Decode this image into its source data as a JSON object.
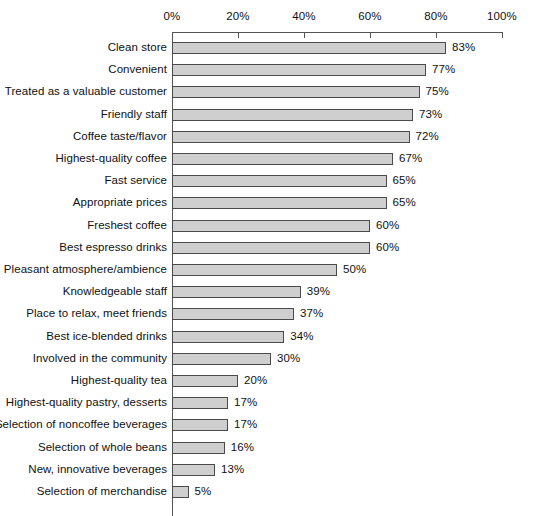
{
  "chart_data": {
    "type": "bar",
    "orientation": "horizontal",
    "title": "",
    "subtitle": "",
    "xlabel": "",
    "ylabel": "",
    "xlim": [
      0,
      100
    ],
    "grid": false,
    "legend": null,
    "tick_labels": [
      "0%",
      "20%",
      "40%",
      "60%",
      "80%",
      "100%"
    ],
    "ticks": [
      0,
      20,
      40,
      60,
      80,
      100
    ],
    "categories": [
      "Clean store",
      "Convenient",
      "Treated as a valuable customer",
      "Friendly staff",
      "Coffee taste/flavor",
      "Highest-quality coffee",
      "Fast service",
      "Appropriate prices",
      "Freshest coffee",
      "Best espresso drinks",
      "Pleasant atmosphere/ambience",
      "Knowledgeable staff",
      "Place to relax, meet friends",
      "Best ice-blended drinks",
      "Involved in the community",
      "Highest-quality tea",
      "Highest-quality pastry, desserts",
      "Selection of noncoffee beverages",
      "Selection of whole beans",
      "New, innovative beverages",
      "Selection of merchandise"
    ],
    "values": [
      83,
      77,
      75,
      73,
      72,
      67,
      65,
      65,
      60,
      60,
      50,
      39,
      37,
      34,
      30,
      20,
      17,
      17,
      16,
      13,
      5
    ],
    "value_labels": [
      "83%",
      "77%",
      "75%",
      "73%",
      "72%",
      "67%",
      "65%",
      "65%",
      "60%",
      "60%",
      "50%",
      "39%",
      "37%",
      "34%",
      "30%",
      "20%",
      "17%",
      "17%",
      "16%",
      "13%",
      "5%"
    ]
  },
  "style": {
    "bar_fill": "#cfcfcf",
    "bar_border": "#4a4a4a",
    "axis_color": "#555555",
    "text_color": "#111111",
    "background": "#ffffff"
  }
}
